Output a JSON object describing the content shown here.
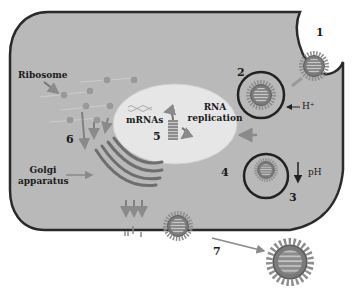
{
  "diagram": {
    "type": "viral life cycle in host cell",
    "colors": {
      "cytoplasm": "#b8b8b8",
      "cell_membrane": "#2a2a2a",
      "nucleus": "#e6e6e6",
      "arrow": "#8a8a8a",
      "virion_core": "#7a7a7a",
      "virion_spikes": "#9a9a9a",
      "endosome_ring": "#222222"
    },
    "labels": {
      "ribosome": "Ribosome",
      "golgi_line1": "Golgi",
      "golgi_line2": "apparatus",
      "mrnas": "mRNAs",
      "rna_line1": "RNA",
      "rna_line2": "replication",
      "proton": "H⁺",
      "ph": "pH",
      "proton_small": "H⁺"
    },
    "steps": [
      "1",
      "2",
      "3",
      "4",
      "5",
      "6",
      "7"
    ]
  }
}
